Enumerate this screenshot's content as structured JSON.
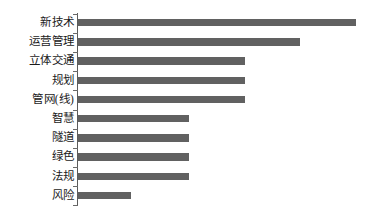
{
  "chart_data": {
    "type": "bar",
    "orientation": "horizontal",
    "title": "",
    "subtitle": "",
    "xlabel": "",
    "ylabel": "",
    "categories": [
      "新技术",
      "运营管理",
      "立体交通",
      "规划",
      "管网(线)",
      "智慧",
      "隧道",
      "绿色",
      "法规",
      "风险"
    ],
    "values": [
      100,
      80,
      60,
      60,
      60,
      40,
      40,
      40,
      40,
      19
    ],
    "xlim": [
      0,
      100
    ],
    "grid": false,
    "legend": false,
    "legend_position": "none",
    "tick_labels_x": [],
    "tick_labels_y": [
      "新技术",
      "运营管理",
      "立体交通",
      "规划",
      "管网(线)",
      "智慧",
      "隧道",
      "绿色",
      "法规",
      "风险"
    ],
    "annotations": [],
    "series": [
      {
        "name": "keyword frequency",
        "values": [
          100,
          80,
          60,
          60,
          60,
          40,
          40,
          40,
          40,
          19
        ]
      }
    ],
    "colors": {
      "bar": "#616161",
      "axis": "#5b5b5b",
      "label": "#1b1b1b",
      "background": "#ffffff"
    }
  }
}
